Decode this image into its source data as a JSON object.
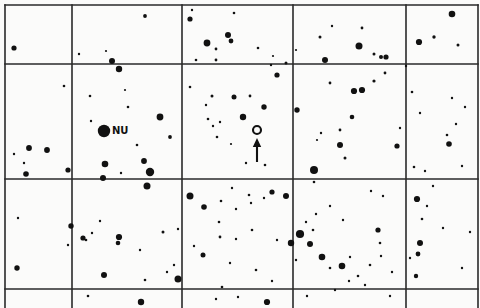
{
  "chart_data": {
    "type": "scatter",
    "title": "",
    "subtitle": "",
    "xlabel": "",
    "ylabel": "",
    "xlim": [
      0,
      480
    ],
    "ylim": [
      0,
      308
    ],
    "grid": true,
    "legend": null,
    "background_color": "#fbfbfa",
    "ink_color": "#111111",
    "grid_color": "#2a2a2a",
    "grid_lines": {
      "vertical_x": [
        5,
        72,
        182,
        293,
        406,
        478
      ],
      "horizontal_y": [
        5,
        64,
        179,
        289
      ],
      "line_width": 1.6
    },
    "annotations": [
      {
        "name": "nu-star-label",
        "text": "NU",
        "x": 112,
        "y": 131,
        "marker": "filled-circle",
        "marker_x": 104,
        "marker_y": 131,
        "marker_radius": 6.2
      },
      {
        "name": "target-marker",
        "text": "",
        "marker": "open-circle",
        "marker_x": 257,
        "marker_y": 130,
        "marker_radius": 4.0
      },
      {
        "name": "target-arrow",
        "text": "",
        "marker": "arrow-up",
        "arrow_x": 257,
        "arrow_y_tail": 162,
        "arrow_y_head": 138
      }
    ],
    "series": [
      {
        "name": "field-stars",
        "marker": "filled-circle",
        "color": "#111111",
        "points": [
          {
            "x": 14,
            "y": 48,
            "r": 2.6
          },
          {
            "x": 79,
            "y": 54,
            "r": 1.2
          },
          {
            "x": 106,
            "y": 51,
            "r": 1.1
          },
          {
            "x": 112,
            "y": 61,
            "r": 3.0
          },
          {
            "x": 119,
            "y": 69,
            "r": 3.2
          },
          {
            "x": 145,
            "y": 16,
            "r": 1.9
          },
          {
            "x": 192,
            "y": 10,
            "r": 1.2
          },
          {
            "x": 190,
            "y": 19,
            "r": 2.6
          },
          {
            "x": 207,
            "y": 43,
            "r": 3.4
          },
          {
            "x": 228,
            "y": 35,
            "r": 3.0
          },
          {
            "x": 231,
            "y": 41,
            "r": 2.4
          },
          {
            "x": 234,
            "y": 13,
            "r": 1.3
          },
          {
            "x": 216,
            "y": 49,
            "r": 1.4
          },
          {
            "x": 258,
            "y": 48,
            "r": 1.3
          },
          {
            "x": 196,
            "y": 60,
            "r": 1.3
          },
          {
            "x": 216,
            "y": 60,
            "r": 1.4
          },
          {
            "x": 273,
            "y": 56,
            "r": 1.1
          },
          {
            "x": 296,
            "y": 50,
            "r": 1.1
          },
          {
            "x": 320,
            "y": 37,
            "r": 1.5
          },
          {
            "x": 332,
            "y": 26,
            "r": 1.2
          },
          {
            "x": 362,
            "y": 28,
            "r": 1.4
          },
          {
            "x": 359,
            "y": 46,
            "r": 3.5
          },
          {
            "x": 325,
            "y": 60,
            "r": 3.0
          },
          {
            "x": 374,
            "y": 54,
            "r": 1.5
          },
          {
            "x": 381,
            "y": 57,
            "r": 2.0
          },
          {
            "x": 386,
            "y": 57,
            "r": 2.6
          },
          {
            "x": 452,
            "y": 14,
            "r": 3.3
          },
          {
            "x": 419,
            "y": 42,
            "r": 3.1
          },
          {
            "x": 434,
            "y": 37,
            "r": 1.7
          },
          {
            "x": 458,
            "y": 45,
            "r": 1.5
          },
          {
            "x": 406,
            "y": 66,
            "r": 1.2
          },
          {
            "x": 64,
            "y": 86,
            "r": 1.3
          },
          {
            "x": 29,
            "y": 148,
            "r": 2.9
          },
          {
            "x": 47,
            "y": 150,
            "r": 2.9
          },
          {
            "x": 14,
            "y": 154,
            "r": 1.2
          },
          {
            "x": 26,
            "y": 174,
            "r": 2.8
          },
          {
            "x": 68,
            "y": 170,
            "r": 2.6
          },
          {
            "x": 24,
            "y": 163,
            "r": 1.2
          },
          {
            "x": 90,
            "y": 96,
            "r": 1.3
          },
          {
            "x": 91,
            "y": 121,
            "r": 1.2
          },
          {
            "x": 125,
            "y": 90,
            "r": 1.1
          },
          {
            "x": 128,
            "y": 107,
            "r": 1.3
          },
          {
            "x": 137,
            "y": 145,
            "r": 1.3
          },
          {
            "x": 144,
            "y": 161,
            "r": 2.9
          },
          {
            "x": 160,
            "y": 117,
            "r": 3.4
          },
          {
            "x": 105,
            "y": 164,
            "r": 3.3
          },
          {
            "x": 170,
            "y": 137,
            "r": 1.9
          },
          {
            "x": 150,
            "y": 172,
            "r": 4.2
          },
          {
            "x": 121,
            "y": 173,
            "r": 1.2
          },
          {
            "x": 190,
            "y": 87,
            "r": 1.3
          },
          {
            "x": 212,
            "y": 96,
            "r": 1.5
          },
          {
            "x": 234,
            "y": 97,
            "r": 2.5
          },
          {
            "x": 250,
            "y": 96,
            "r": 1.4
          },
          {
            "x": 206,
            "y": 105,
            "r": 1.2
          },
          {
            "x": 264,
            "y": 107,
            "r": 2.7
          },
          {
            "x": 208,
            "y": 119,
            "r": 1.3
          },
          {
            "x": 213,
            "y": 126,
            "r": 1.2
          },
          {
            "x": 220,
            "y": 122,
            "r": 1.2
          },
          {
            "x": 243,
            "y": 117,
            "r": 3.2
          },
          {
            "x": 217,
            "y": 137,
            "r": 1.3
          },
          {
            "x": 231,
            "y": 144,
            "r": 1.1
          },
          {
            "x": 246,
            "y": 163,
            "r": 1.2
          },
          {
            "x": 265,
            "y": 165,
            "r": 1.3
          },
          {
            "x": 277,
            "y": 75,
            "r": 2.6
          },
          {
            "x": 286,
            "y": 63,
            "r": 1.5
          },
          {
            "x": 271,
            "y": 65,
            "r": 1.2
          },
          {
            "x": 330,
            "y": 83,
            "r": 1.4
          },
          {
            "x": 354,
            "y": 91,
            "r": 3.1
          },
          {
            "x": 362,
            "y": 90,
            "r": 3.1
          },
          {
            "x": 374,
            "y": 81,
            "r": 1.6
          },
          {
            "x": 385,
            "y": 73,
            "r": 1.4
          },
          {
            "x": 297,
            "y": 110,
            "r": 2.7
          },
          {
            "x": 352,
            "y": 117,
            "r": 2.3
          },
          {
            "x": 340,
            "y": 130,
            "r": 1.4
          },
          {
            "x": 321,
            "y": 133,
            "r": 1.2
          },
          {
            "x": 317,
            "y": 140,
            "r": 1.1
          },
          {
            "x": 340,
            "y": 145,
            "r": 3.0
          },
          {
            "x": 345,
            "y": 158,
            "r": 1.5
          },
          {
            "x": 397,
            "y": 146,
            "r": 2.6
          },
          {
            "x": 314,
            "y": 170,
            "r": 4.0
          },
          {
            "x": 400,
            "y": 128,
            "r": 1.2
          },
          {
            "x": 412,
            "y": 92,
            "r": 1.3
          },
          {
            "x": 452,
            "y": 98,
            "r": 1.2
          },
          {
            "x": 420,
            "y": 113,
            "r": 1.2
          },
          {
            "x": 465,
            "y": 107,
            "r": 1.2
          },
          {
            "x": 456,
            "y": 124,
            "r": 1.2
          },
          {
            "x": 447,
            "y": 135,
            "r": 1.3
          },
          {
            "x": 449,
            "y": 144,
            "r": 2.8
          },
          {
            "x": 414,
            "y": 167,
            "r": 1.3
          },
          {
            "x": 425,
            "y": 171,
            "r": 1.2
          },
          {
            "x": 462,
            "y": 166,
            "r": 1.2
          },
          {
            "x": 103,
            "y": 178,
            "r": 3.0
          },
          {
            "x": 147,
            "y": 186,
            "r": 3.5
          },
          {
            "x": 190,
            "y": 196,
            "r": 3.5
          },
          {
            "x": 204,
            "y": 207,
            "r": 2.8
          },
          {
            "x": 221,
            "y": 201,
            "r": 1.3
          },
          {
            "x": 249,
            "y": 195,
            "r": 1.3
          },
          {
            "x": 251,
            "y": 203,
            "r": 1.2
          },
          {
            "x": 264,
            "y": 198,
            "r": 1.2
          },
          {
            "x": 272,
            "y": 192,
            "r": 2.6
          },
          {
            "x": 286,
            "y": 196,
            "r": 3.0
          },
          {
            "x": 232,
            "y": 188,
            "r": 1.2
          },
          {
            "x": 314,
            "y": 182,
            "r": 1.3
          },
          {
            "x": 371,
            "y": 191,
            "r": 1.2
          },
          {
            "x": 383,
            "y": 196,
            "r": 1.2
          },
          {
            "x": 417,
            "y": 199,
            "r": 3.1
          },
          {
            "x": 427,
            "y": 206,
            "r": 1.2
          },
          {
            "x": 433,
            "y": 186,
            "r": 1.2
          },
          {
            "x": 18,
            "y": 218,
            "r": 1.2
          },
          {
            "x": 71,
            "y": 226,
            "r": 2.7
          },
          {
            "x": 86,
            "y": 240,
            "r": 1.3
          },
          {
            "x": 92,
            "y": 233,
            "r": 1.2
          },
          {
            "x": 119,
            "y": 237,
            "r": 3.1
          },
          {
            "x": 100,
            "y": 221,
            "r": 1.2
          },
          {
            "x": 140,
            "y": 250,
            "r": 1.2
          },
          {
            "x": 163,
            "y": 232,
            "r": 1.5
          },
          {
            "x": 178,
            "y": 229,
            "r": 1.2
          },
          {
            "x": 174,
            "y": 265,
            "r": 1.2
          },
          {
            "x": 194,
            "y": 246,
            "r": 1.2
          },
          {
            "x": 219,
            "y": 222,
            "r": 1.3
          },
          {
            "x": 236,
            "y": 209,
            "r": 1.2
          },
          {
            "x": 236,
            "y": 239,
            "r": 1.2
          },
          {
            "x": 17,
            "y": 268,
            "r": 2.7
          },
          {
            "x": 68,
            "y": 245,
            "r": 1.2
          },
          {
            "x": 83,
            "y": 238,
            "r": 2.6
          },
          {
            "x": 118,
            "y": 243,
            "r": 2.3
          },
          {
            "x": 104,
            "y": 275,
            "r": 3.0
          },
          {
            "x": 145,
            "y": 280,
            "r": 1.3
          },
          {
            "x": 178,
            "y": 279,
            "r": 3.5
          },
          {
            "x": 167,
            "y": 272,
            "r": 1.2
          },
          {
            "x": 222,
            "y": 287,
            "r": 1.3
          },
          {
            "x": 203,
            "y": 255,
            "r": 2.5
          },
          {
            "x": 230,
            "y": 263,
            "r": 1.2
          },
          {
            "x": 256,
            "y": 270,
            "r": 1.3
          },
          {
            "x": 272,
            "y": 281,
            "r": 1.2
          },
          {
            "x": 220,
            "y": 237,
            "r": 1.4
          },
          {
            "x": 252,
            "y": 230,
            "r": 1.3
          },
          {
            "x": 277,
            "y": 240,
            "r": 1.2
          },
          {
            "x": 300,
            "y": 234,
            "r": 4.1
          },
          {
            "x": 291,
            "y": 243,
            "r": 3.2
          },
          {
            "x": 310,
            "y": 244,
            "r": 3.0
          },
          {
            "x": 296,
            "y": 260,
            "r": 1.2
          },
          {
            "x": 313,
            "y": 230,
            "r": 1.3
          },
          {
            "x": 306,
            "y": 222,
            "r": 1.2
          },
          {
            "x": 316,
            "y": 214,
            "r": 1.2
          },
          {
            "x": 322,
            "y": 257,
            "r": 3.3
          },
          {
            "x": 342,
            "y": 266,
            "r": 3.3
          },
          {
            "x": 330,
            "y": 268,
            "r": 1.3
          },
          {
            "x": 350,
            "y": 257,
            "r": 1.2
          },
          {
            "x": 358,
            "y": 276,
            "r": 1.3
          },
          {
            "x": 349,
            "y": 281,
            "r": 1.2
          },
          {
            "x": 370,
            "y": 265,
            "r": 1.3
          },
          {
            "x": 381,
            "y": 256,
            "r": 1.2
          },
          {
            "x": 365,
            "y": 285,
            "r": 1.2
          },
          {
            "x": 335,
            "y": 290,
            "r": 1.2
          },
          {
            "x": 380,
            "y": 243,
            "r": 1.3
          },
          {
            "x": 378,
            "y": 230,
            "r": 2.6
          },
          {
            "x": 343,
            "y": 220,
            "r": 1.2
          },
          {
            "x": 330,
            "y": 206,
            "r": 1.2
          },
          {
            "x": 392,
            "y": 272,
            "r": 1.2
          },
          {
            "x": 420,
            "y": 243,
            "r": 3.0
          },
          {
            "x": 418,
            "y": 254,
            "r": 2.4
          },
          {
            "x": 410,
            "y": 258,
            "r": 1.2
          },
          {
            "x": 416,
            "y": 276,
            "r": 2.2
          },
          {
            "x": 443,
            "y": 228,
            "r": 1.2
          },
          {
            "x": 422,
            "y": 219,
            "r": 1.3
          },
          {
            "x": 462,
            "y": 268,
            "r": 1.2
          },
          {
            "x": 470,
            "y": 232,
            "r": 1.2
          },
          {
            "x": 88,
            "y": 296,
            "r": 1.3
          },
          {
            "x": 141,
            "y": 302,
            "r": 3.2
          },
          {
            "x": 216,
            "y": 299,
            "r": 1.2
          },
          {
            "x": 267,
            "y": 302,
            "r": 3.1
          },
          {
            "x": 307,
            "y": 296,
            "r": 1.2
          },
          {
            "x": 238,
            "y": 297,
            "r": 1.2
          },
          {
            "x": 390,
            "y": 296,
            "r": 1.2
          }
        ]
      }
    ]
  }
}
